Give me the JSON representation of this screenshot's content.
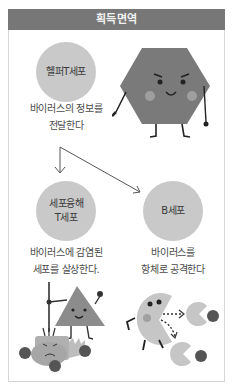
{
  "title": "획득면역",
  "nodes": [
    {
      "id": "helper-t",
      "label": "헬퍼T세포",
      "caption": "바이러스의 정보를\n전달한다"
    },
    {
      "id": "killer-t",
      "label": "세포융해\nT세포",
      "caption": "바이러스에 감염된\n세포를 살상한다."
    },
    {
      "id": "b-cell",
      "label": "B세포",
      "caption": "바이러스를\n항체로 공격한다"
    }
  ],
  "edges": [
    {
      "from": "helper-t",
      "to": "killer-t"
    },
    {
      "from": "helper-t",
      "to": "b-cell"
    }
  ],
  "illustrations": [
    {
      "name": "hexagon-character-pointing"
    },
    {
      "name": "triangle-character-with-pitchfork-and-infected-cell"
    },
    {
      "name": "pacman-character-shooting-antibodies"
    }
  ],
  "colors": {
    "header_bg": "#777777",
    "circle_fill": "#c9c9c9",
    "border": "#d6d6d6"
  }
}
